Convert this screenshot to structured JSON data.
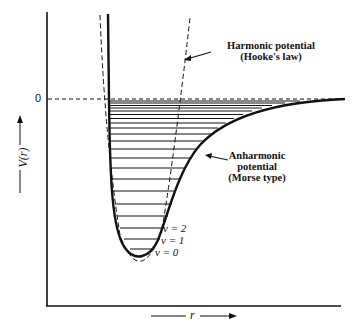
{
  "diagram": {
    "y_axis_label": "V(r)",
    "x_axis_label": "r",
    "zero_label": "0",
    "harmonic_label_line1": "Harmonic potential",
    "harmonic_label_line2": "(Hooke's law)",
    "anharmonic_label_line1": "Anharmonic",
    "anharmonic_label_line2": "potential",
    "anharmonic_label_line3": "(Morse type)",
    "levels": [
      "v = 2",
      "v = 1",
      "v = 0"
    ]
  },
  "colors": {
    "ink": "#111111",
    "background": "#ffffff"
  }
}
